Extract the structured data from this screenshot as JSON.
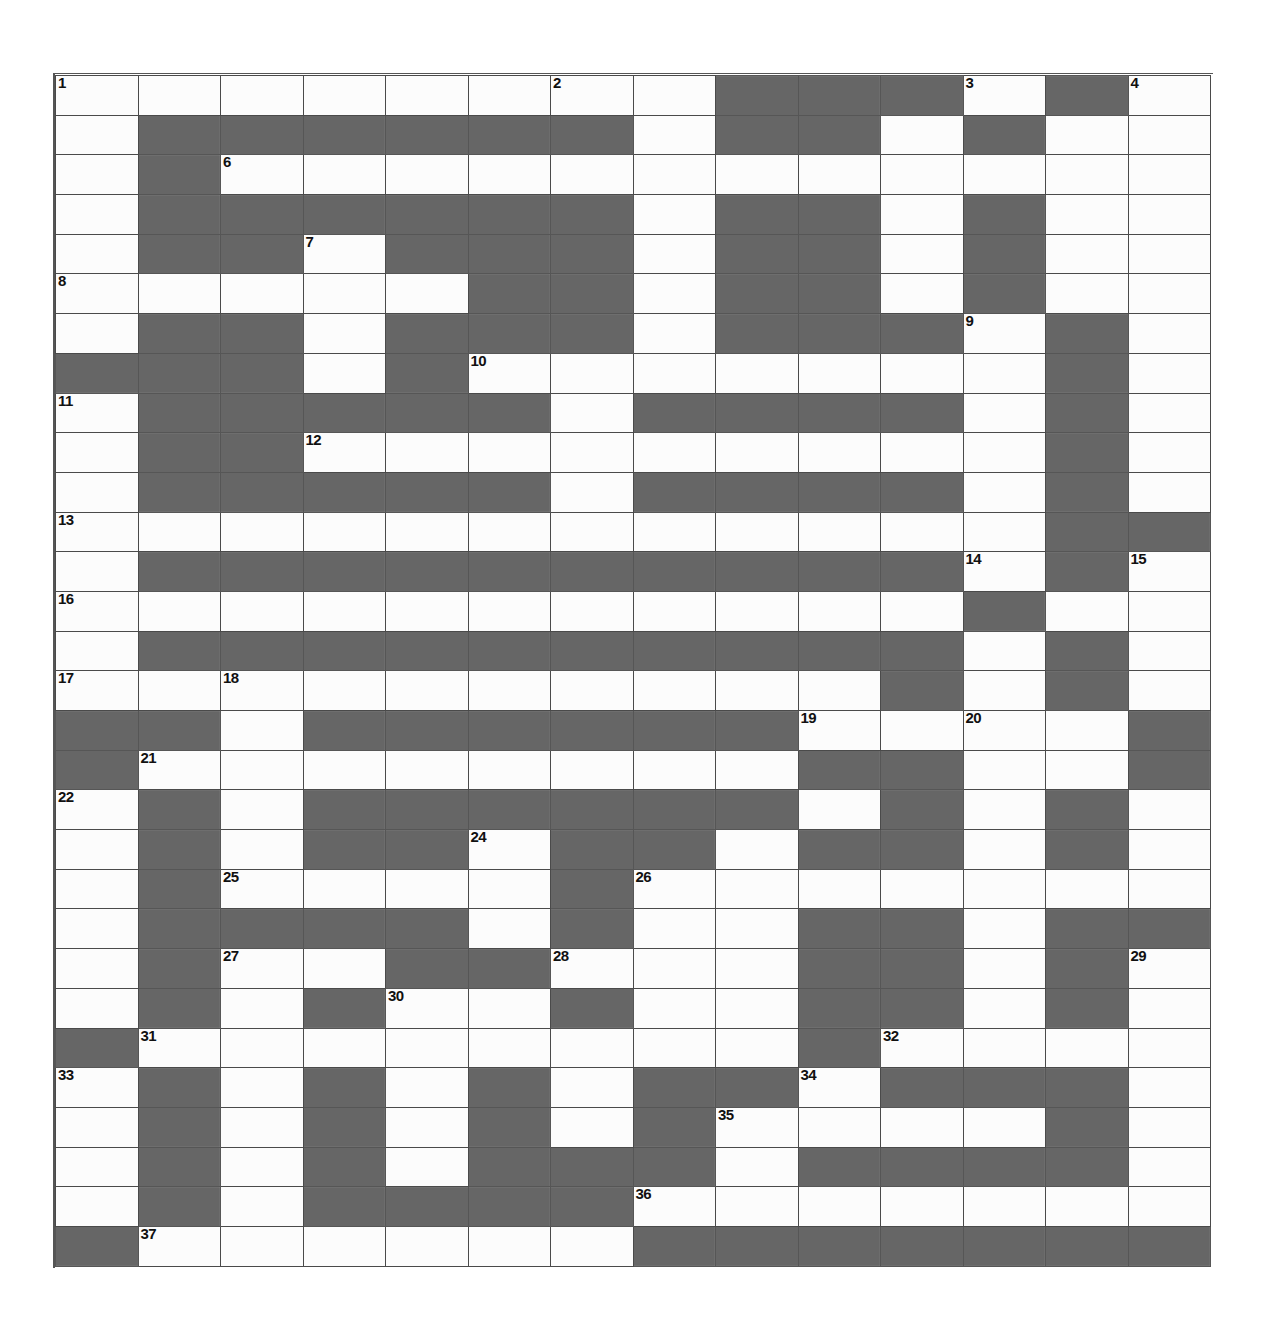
{
  "puzzle": {
    "type": "crossword-grid",
    "columns": 14,
    "rows": 30,
    "cell_width_px": 82.5,
    "cell_height_px": 39.7,
    "colors": {
      "block": "#565656",
      "cell": "#fcfcfc",
      "grid_line": "#4a4a4a",
      "number_text": "#111111",
      "page_background": "#ffffff"
    },
    "clue_numbers_present": [
      1,
      2,
      3,
      4,
      5,
      6,
      7,
      8,
      9,
      10,
      11,
      12,
      13,
      14,
      15,
      16,
      17,
      18,
      19,
      20,
      21,
      22,
      23,
      24,
      25,
      26,
      27,
      28,
      29,
      30,
      31,
      32,
      33,
      34,
      35,
      36,
      37
    ],
    "max_clue_number": 37,
    "grid": [
      "WWWWWWWWBBBWBW",
      "WBBBBBBWBBWBWW",
      "WBWWWWWWWWWWWW",
      "WBBBBBBWBBWBWW",
      "WBBWBBBWBBWBWW",
      "WWWWWBBWBBWBWW",
      "WBBWBBBWBBBWBW",
      "BBBWBWWWWWWWBW",
      "WBBBBBWBBBBWBW",
      "WBBWWWWWWWWWBW",
      "WBBBBBWBBBBWBW",
      "WWWWWWWWWWWWBB",
      "WBBBBBBBBBBWBW",
      "WWWWWWWWWWWBWW",
      "WBBBBBBBBBBWBW",
      "WWWWWWWWWWBWBW",
      "BBWBBBBBBWWWWB",
      "BWWWWWWWWBBWWB",
      "WBWBBBBBBWBWBW",
      "WBWBBWBBWBBWBW",
      "WBWWWWBWWWWWWW",
      "WBBBBWBWWBBWBB",
      "WBWWBBWWWBBWBW",
      "WBWBWWBWWBBWBW",
      "BWWWWWWWWBWWWW",
      "WBWBWBWBBWBBBW",
      "WBWBWBWBWWWWBW",
      "WBWBWBBBWBBBBW",
      "WBWBBBBWWWWWWW",
      "BWWWWWWBBBBBBB"
    ],
    "numbered_cells": [
      {
        "number": 1,
        "row": 1,
        "col": 1
      },
      {
        "number": 2,
        "row": 1,
        "col": 7
      },
      {
        "number": 3,
        "row": 1,
        "col": 12
      },
      {
        "number": 4,
        "row": 1,
        "col": 14
      },
      {
        "number": 5,
        "row": 2,
        "col": 10
      },
      {
        "number": 6,
        "row": 3,
        "col": 3
      },
      {
        "number": 7,
        "row": 5,
        "col": 4
      },
      {
        "number": 8,
        "row": 6,
        "col": 1
      },
      {
        "number": 9,
        "row": 7,
        "col": 12
      },
      {
        "number": 10,
        "row": 8,
        "col": 6
      },
      {
        "number": 11,
        "row": 9,
        "col": 1
      },
      {
        "number": 12,
        "row": 10,
        "col": 4
      },
      {
        "number": 13,
        "row": 12,
        "col": 1
      },
      {
        "number": 14,
        "row": 13,
        "col": 12
      },
      {
        "number": 15,
        "row": 13,
        "col": 14
      },
      {
        "number": 16,
        "row": 14,
        "col": 1
      },
      {
        "number": 17,
        "row": 16,
        "col": 1
      },
      {
        "number": 18,
        "row": 16,
        "col": 3
      },
      {
        "number": 19,
        "row": 17,
        "col": 10
      },
      {
        "number": 20,
        "row": 17,
        "col": 12
      },
      {
        "number": 21,
        "row": 18,
        "col": 2
      },
      {
        "number": 22,
        "row": 19,
        "col": 1
      },
      {
        "number": 23,
        "row": 19,
        "col": 9
      },
      {
        "number": 24,
        "row": 20,
        "col": 6
      },
      {
        "number": 25,
        "row": 21,
        "col": 3
      },
      {
        "number": 26,
        "row": 21,
        "col": 8
      },
      {
        "number": 27,
        "row": 23,
        "col": 3
      },
      {
        "number": 28,
        "row": 23,
        "col": 7
      },
      {
        "number": 29,
        "row": 23,
        "col": 14
      },
      {
        "number": 30,
        "row": 24,
        "col": 5
      },
      {
        "number": 31,
        "row": 25,
        "col": 2
      },
      {
        "number": 32,
        "row": 25,
        "col": 11
      },
      {
        "number": 33,
        "row": 26,
        "col": 1
      },
      {
        "number": 34,
        "row": 26,
        "col": 10
      },
      {
        "number": 35,
        "row": 27,
        "col": 9
      },
      {
        "number": 36,
        "row": 29,
        "col": 8
      },
      {
        "number": 37,
        "row": 30,
        "col": 2
      }
    ]
  }
}
